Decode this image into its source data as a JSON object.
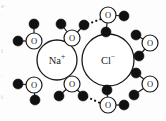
{
  "figure": {
    "type": "chemistry-diagram",
    "background_color": "#fdfdfd",
    "width": 166,
    "height": 121
  },
  "colors": {
    "ion_outline": "#1a1a1a",
    "ion_fill": "#ffffff",
    "oxygen_outline": "#1a1a1a",
    "oxygen_fill": "#ffffff",
    "hydrogen_fill": "#111111",
    "bond_stroke": "#1a1a1a",
    "hbond_stroke": "#111111",
    "label_color": "#1a1a1a",
    "edge_text_color": "#b9b9b9"
  },
  "ions": [
    {
      "id": "sodium",
      "label": "Na",
      "charge": "+",
      "cx": 57,
      "cy": 60,
      "r": 20
    },
    {
      "id": "chloride",
      "label": "Cl",
      "charge": "−",
      "cx": 108,
      "cy": 60,
      "r": 26
    }
  ],
  "oxygen_label": "O",
  "waters": [
    {
      "id": "water-top-left-outer",
      "o": {
        "cx": 34,
        "cy": 41,
        "r": 8
      },
      "h": [
        {
          "cx": 18,
          "cy": 41,
          "r": 5
        },
        {
          "cx": 34,
          "cy": 24,
          "r": 5
        }
      ]
    },
    {
      "id": "water-top-center",
      "o": {
        "cx": 72,
        "cy": 38,
        "r": 8
      },
      "h": [
        {
          "cx": 61,
          "cy": 24,
          "r": 5
        },
        {
          "cx": 84,
          "cy": 25,
          "r": 5
        }
      ]
    },
    {
      "id": "water-top-right",
      "o": {
        "cx": 108,
        "cy": 15,
        "r": 8
      },
      "h": [
        {
          "cx": 124,
          "cy": 16,
          "r": 5
        },
        {
          "cx": 106,
          "cy": 32,
          "r": 5
        }
      ]
    },
    {
      "id": "water-right-upper",
      "o": {
        "cx": 150,
        "cy": 43,
        "r": 8
      },
      "h": [
        {
          "cx": 136,
          "cy": 35,
          "r": 5
        },
        {
          "cx": 139,
          "cy": 56,
          "r": 5
        }
      ]
    },
    {
      "id": "water-right-lower",
      "o": {
        "cx": 150,
        "cy": 84,
        "r": 8
      },
      "h": [
        {
          "cx": 136,
          "cy": 73,
          "r": 5
        },
        {
          "cx": 134,
          "cy": 95,
          "r": 5
        }
      ]
    },
    {
      "id": "water-bottom-left-outer",
      "o": {
        "cx": 34,
        "cy": 85,
        "r": 8
      },
      "h": [
        {
          "cx": 18,
          "cy": 84,
          "r": 5
        },
        {
          "cx": 35,
          "cy": 100,
          "r": 5
        }
      ]
    },
    {
      "id": "water-bottom-center",
      "o": {
        "cx": 72,
        "cy": 84,
        "r": 8
      },
      "h": [
        {
          "cx": 59,
          "cy": 96,
          "r": 5
        },
        {
          "cx": 83,
          "cy": 96,
          "r": 5
        }
      ]
    },
    {
      "id": "water-bottom-right",
      "o": {
        "cx": 108,
        "cy": 105,
        "r": 8
      },
      "h": [
        {
          "cx": 124,
          "cy": 105,
          "r": 5
        },
        {
          "cx": 107,
          "cy": 90,
          "r": 5
        }
      ]
    }
  ],
  "hydrogen_bonds": [
    {
      "id": "hbond-top",
      "from": {
        "x": 88,
        "y": 24
      },
      "to": {
        "x": 101,
        "y": 19
      },
      "style": "dotted"
    },
    {
      "id": "hbond-bottom",
      "from": {
        "x": 87,
        "y": 97
      },
      "to": {
        "x": 100,
        "y": 103
      },
      "style": "dotted"
    }
  ],
  "edge_marginalia": [
    {
      "id": "margin-line-1",
      "text": "e",
      "top": 3
    },
    {
      "id": "margin-line-2",
      "text": "·",
      "top": 12
    },
    {
      "id": "margin-line-3",
      "text": "l",
      "top": 48
    },
    {
      "id": "margin-line-4",
      "text": ".",
      "top": 72
    },
    {
      "id": "margin-line-5",
      "text": "i",
      "top": 94
    }
  ]
}
